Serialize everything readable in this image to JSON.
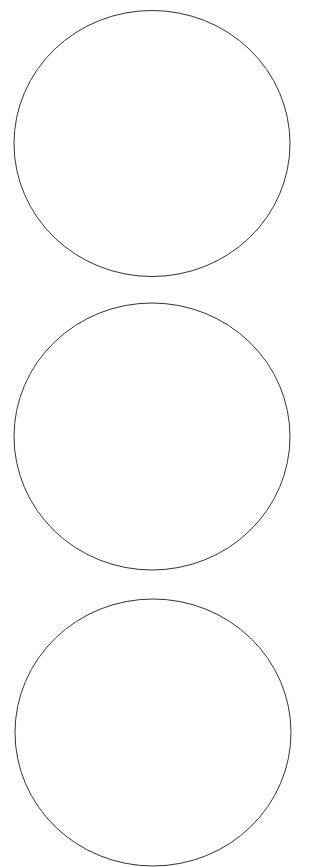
{
  "diagram": {
    "title": "",
    "shapes": [
      {
        "id": "circle-1",
        "kind": "circle",
        "label": "",
        "stroke": "#333333",
        "fill": "#ffffff"
      },
      {
        "id": "circle-2",
        "kind": "circle",
        "label": "",
        "stroke": "#333333",
        "fill": "#ffffff"
      },
      {
        "id": "circle-3",
        "kind": "circle",
        "label": "",
        "stroke": "#333333",
        "fill": "#ffffff"
      }
    ]
  }
}
